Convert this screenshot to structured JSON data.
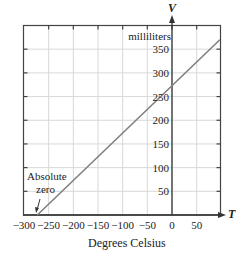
{
  "chart_data": {
    "type": "line",
    "title": "",
    "xlabel": "Degrees Celsius",
    "ylabel": "milliliters",
    "x_axis_name": "T",
    "y_axis_name": "V",
    "xlim": [
      -300,
      100
    ],
    "ylim": [
      0,
      400
    ],
    "x_ticks": [
      -300,
      -250,
      -200,
      -150,
      -100,
      -50,
      0,
      50
    ],
    "x_tick_labels": [
      "−300",
      "−250",
      "−200",
      "−150",
      "−100",
      "−50",
      "0",
      "50"
    ],
    "y_ticks": [
      50,
      100,
      150,
      200,
      250,
      300,
      350
    ],
    "y_tick_labels": [
      "50",
      "100",
      "150",
      "200",
      "250",
      "300",
      "350"
    ],
    "grid": true,
    "series": [
      {
        "name": "Volume vs Temperature",
        "x": [
          -273,
          -200,
          -100,
          0,
          97
        ],
        "y": [
          0,
          73,
          173,
          273,
          370
        ],
        "color": "#808080"
      }
    ],
    "annotations": [
      {
        "text": "Absolute\nzero",
        "line1": "Absolute",
        "line2": "zero",
        "x": -273,
        "y": 0,
        "arrow": true
      }
    ]
  }
}
